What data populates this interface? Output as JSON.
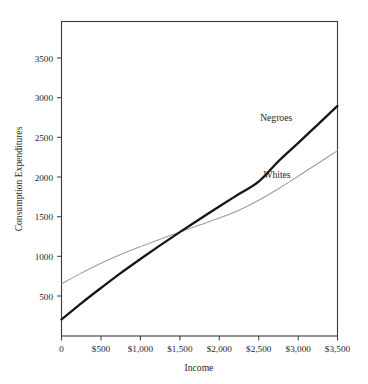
{
  "chart_data": {
    "type": "line",
    "title": "",
    "xlabel": "Income",
    "ylabel": "Consumption Expenditures",
    "xlim": [
      0,
      3500
    ],
    "ylim": [
      0,
      3800
    ],
    "grid": false,
    "legend_position": "inline-annotations",
    "x_ticks": [
      0,
      500,
      1000,
      1500,
      2000,
      2500,
      3000,
      3500
    ],
    "x_tick_labels": [
      "0",
      "$500",
      "$1,000",
      "$1,500",
      "$2,000",
      "$2,500",
      "$3,000",
      "$3,500"
    ],
    "y_ticks": [
      500,
      1000,
      1500,
      2000,
      2500,
      3000,
      3500
    ],
    "y_tick_labels": [
      "500",
      "1000",
      "1500",
      "2000",
      "2500",
      "3000",
      "3500"
    ],
    "x": [
      0,
      250,
      500,
      750,
      1000,
      1250,
      1500,
      1750,
      2000,
      2250,
      2500,
      2750,
      3000,
      3250,
      3500
    ],
    "series": [
      {
        "name": "Negroes",
        "label": "Negroes",
        "color": "#161616",
        "line_width": 2.3,
        "values": [
          200,
          395,
          580,
          760,
          930,
          1095,
          1255,
          1410,
          1565,
          1715,
          1865,
          2110,
          2330,
          2555,
          2780
        ],
        "annotation": {
          "text": "Negroes",
          "x": 2520,
          "y": 2600
        }
      },
      {
        "name": "Whites",
        "label": "Whites",
        "color": "#9c9c9c",
        "line_width": 1.05,
        "values": [
          630,
          760,
          880,
          985,
          1080,
          1170,
          1255,
          1340,
          1425,
          1520,
          1640,
          1780,
          1930,
          2085,
          2240
        ],
        "annotation": {
          "text": "Whites",
          "x": 2560,
          "y": 1905
        }
      }
    ],
    "annotations": [
      {
        "text": "Negroes",
        "series": "Negroes"
      },
      {
        "text": "Whites",
        "series": "Whites"
      }
    ],
    "colors": {
      "background": "#ffffff",
      "frame": "#3b3b3b",
      "text": "#1f1f1f",
      "series_primary": "#161616",
      "series_secondary": "#9c9c9c"
    }
  }
}
